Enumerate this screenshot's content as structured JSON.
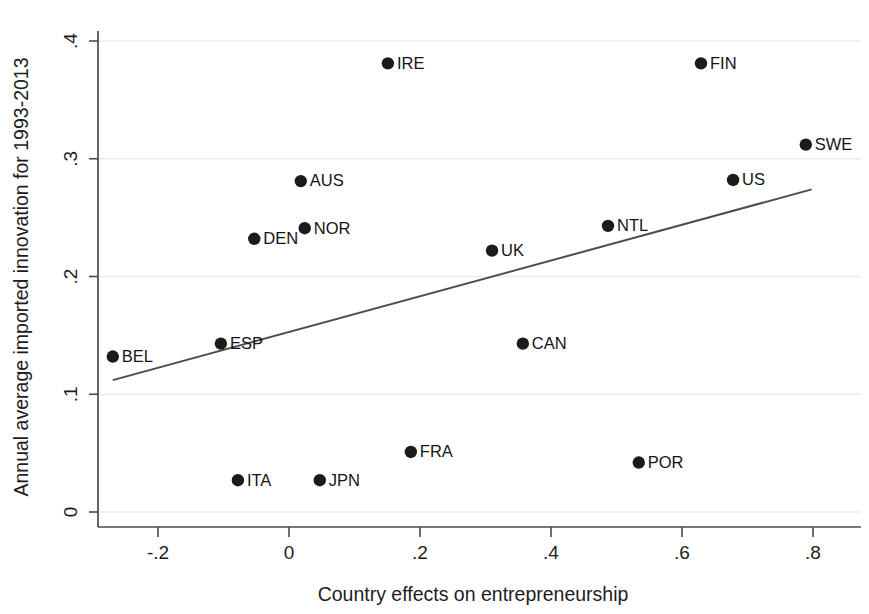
{
  "chart_data": {
    "type": "scatter",
    "title": "",
    "xlabel": "Country effects on entrepreneurship",
    "ylabel": "Annual average imported innovation for 1993-2013",
    "xlim": [
      -0.3,
      0.86
    ],
    "ylim": [
      -0.012,
      0.412
    ],
    "xticks": [
      -0.2,
      0,
      0.2,
      0.4,
      0.6,
      0.8
    ],
    "xticklabels": [
      "-.2",
      "0",
      ".2",
      ".4",
      ".6",
      ".8"
    ],
    "yticks": [
      0,
      0.1,
      0.2,
      0.3,
      0.4
    ],
    "yticklabels": [
      "0",
      ".1",
      ".2",
      ".3",
      ".4"
    ],
    "grid": "horizontal",
    "legend": "none",
    "marker_color": "#1b1b1b",
    "fit_line_color": "#4d4d4d",
    "grid_color": "#ececec",
    "axis_color": "#4a4a4a",
    "points": [
      {
        "label": "BEL",
        "x": -0.269,
        "y": 0.132,
        "label_side": "right"
      },
      {
        "label": "ESP",
        "x": -0.104,
        "y": 0.143,
        "label_side": "right"
      },
      {
        "label": "DEN",
        "x": -0.053,
        "y": 0.232,
        "label_side": "right"
      },
      {
        "label": "ITA",
        "x": -0.078,
        "y": 0.027,
        "label_side": "right"
      },
      {
        "label": "AUS",
        "x": 0.018,
        "y": 0.281,
        "label_side": "right"
      },
      {
        "label": "NOR",
        "x": 0.024,
        "y": 0.241,
        "label_side": "right"
      },
      {
        "label": "JPN",
        "x": 0.047,
        "y": 0.027,
        "label_side": "right"
      },
      {
        "label": "IRE",
        "x": 0.151,
        "y": 0.381,
        "label_side": "right"
      },
      {
        "label": "FRA",
        "x": 0.186,
        "y": 0.051,
        "label_side": "right"
      },
      {
        "label": "UK",
        "x": 0.31,
        "y": 0.222,
        "label_side": "right"
      },
      {
        "label": "CAN",
        "x": 0.357,
        "y": 0.143,
        "label_side": "right"
      },
      {
        "label": "NTL",
        "x": 0.487,
        "y": 0.243,
        "label_side": "right"
      },
      {
        "label": "POR",
        "x": 0.534,
        "y": 0.042,
        "label_side": "right"
      },
      {
        "label": "FIN",
        "x": 0.629,
        "y": 0.381,
        "label_side": "right"
      },
      {
        "label": "US",
        "x": 0.678,
        "y": 0.282,
        "label_side": "right"
      },
      {
        "label": "SWE",
        "x": 0.789,
        "y": 0.312,
        "label_side": "right"
      }
    ],
    "fit_line": {
      "x0": -0.269,
      "y0": 0.112,
      "x1": 0.798,
      "y1": 0.274
    }
  }
}
